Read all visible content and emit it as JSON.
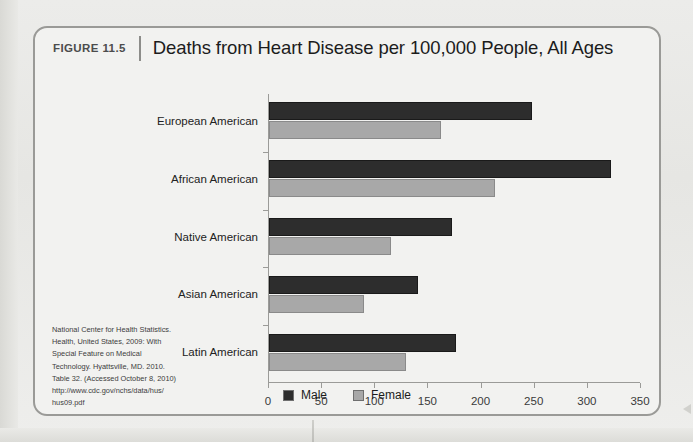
{
  "figure": {
    "number_label": "FIGURE 11.5",
    "title": "Deaths from Heart Disease per 100,000 People, All Ages"
  },
  "source_lines": [
    "National Center for Health Statistics.",
    "Health, United States, 2009: With",
    "Special Feature on Medical",
    "Technology. Hyattsville, MD. 2010.",
    "Table 32. (Accessed October 8, 2010)",
    "http://www.cdc.gov/nchs/data/hus/",
    "hus09.pdf"
  ],
  "colors": {
    "male": "#2d2d2d",
    "female": "#a8a8a8",
    "axis": "#9b9b98",
    "frame": "#9a9a97"
  },
  "chart_data": {
    "type": "bar",
    "orientation": "horizontal",
    "title": "Deaths from Heart Disease per 100,000 People, All Ages",
    "xlabel": "",
    "ylabel": "",
    "xlim": [
      0,
      350
    ],
    "xticks": [
      0,
      50,
      100,
      150,
      200,
      250,
      300,
      350
    ],
    "grid": false,
    "legend_position": "bottom",
    "categories": [
      "European American",
      "African American",
      "Native American",
      "Asian American",
      "Latin American"
    ],
    "series": [
      {
        "name": "Male",
        "values": [
          247,
          322,
          172,
          140,
          176
        ]
      },
      {
        "name": "Female",
        "values": [
          162,
          213,
          115,
          89,
          129
        ]
      }
    ]
  }
}
